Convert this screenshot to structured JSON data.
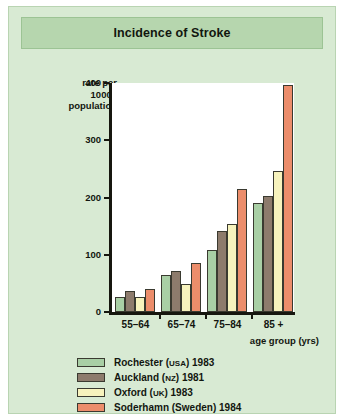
{
  "card": {
    "title": "Incidence of Stroke"
  },
  "chart_data": {
    "type": "bar",
    "title": "Incidence of Stroke",
    "xlabel": "age group (yrs)",
    "ylabel": "rate per 10000 population",
    "ylabel_lines": [
      "rate per",
      "10000",
      "population"
    ],
    "ylim": [
      0,
      400
    ],
    "yticks": [
      0,
      100,
      200,
      300,
      400
    ],
    "ytick_labels": [
      "0",
      "100",
      "200",
      "300",
      "400"
    ],
    "grid": false,
    "legend_position": "bottom",
    "categories": [
      "55–64",
      "65–74",
      "75–84",
      "85 +"
    ],
    "series": [
      {
        "name": "Rochester (USA) 1983",
        "place": "Rochester",
        "country": "USA",
        "year": "1983",
        "color": "#a9cfa5",
        "values": [
          25,
          63,
          107,
          190
        ]
      },
      {
        "name": "Auckland (NZ) 1981",
        "place": "Auckland",
        "country": "NZ",
        "year": "1981",
        "color": "#8d7b6c",
        "values": [
          35,
          70,
          141,
          202
        ]
      },
      {
        "name": "Oxford (UK) 1983",
        "place": "Oxford",
        "country": "UK",
        "year": "1983",
        "color": "#f7f3bd",
        "values": [
          25,
          48,
          152,
          245
        ]
      },
      {
        "name": "Soderhamn (Sweden) 1984",
        "place": "Soderhamn",
        "country": "Sweden",
        "year": "1984",
        "color": "#ec8d6b",
        "values": [
          40,
          84,
          214,
          396
        ]
      }
    ]
  },
  "colors": {
    "card_background": "#d8ead3",
    "title_background": "#b6d6ae",
    "plot_background": "#ffffff",
    "axis": "#16170f"
  }
}
